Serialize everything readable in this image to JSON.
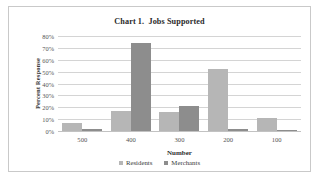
{
  "chart_data": {
    "type": "bar",
    "title": "Chart 1.  Jobs Supported",
    "xlabel": "Number",
    "ylabel": "Percent Response",
    "categories": [
      "500",
      "400",
      "300",
      "200",
      "100"
    ],
    "series": [
      {
        "name": "Residents",
        "color": "#b6b6b6",
        "values": [
          7,
          17,
          16,
          52,
          11
        ]
      },
      {
        "name": "Merchants",
        "color": "#8d8d8d",
        "values": [
          2,
          74,
          21,
          2,
          1
        ]
      }
    ],
    "ylim": [
      0,
      80
    ],
    "yticks": [
      "0%",
      "10%",
      "20%",
      "30%",
      "40%",
      "50%",
      "60%",
      "70%",
      "80%"
    ],
    "ytick_values": [
      0,
      10,
      20,
      30,
      40,
      50,
      60,
      70,
      80
    ],
    "grid": true,
    "legend_position": "bottom",
    "value_suffix": "%"
  }
}
